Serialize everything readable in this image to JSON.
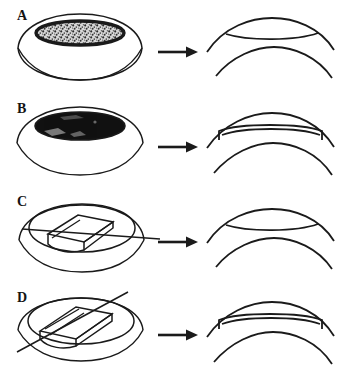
{
  "figure": {
    "background_color": "#ffffff",
    "ink_color": "#1a1a1a",
    "width": 346,
    "height": 372,
    "panel_count": 4
  },
  "panels": [
    {
      "label": "A",
      "left_view": {
        "name": "cornea-dome-surface-ablation-shallow",
        "dome_type": "flattened-dome",
        "treatment_zone": "stippled-ellipse",
        "treatment_fill": "stipple-light",
        "depth": "shallow"
      },
      "arrow": {
        "name": "transform-arrow",
        "direction": "right",
        "glyph": "solid-arrow"
      },
      "right_view": {
        "name": "cornea-cross-section-thin-lenticule",
        "profile": "thin-lenticule",
        "has_end_walls": false,
        "layers": 2
      }
    },
    {
      "label": "B",
      "left_view": {
        "name": "cornea-dome-surface-ablation-deep",
        "dome_type": "flattened-dome",
        "treatment_zone": "solid-ellipse",
        "treatment_fill": "solid-black",
        "depth": "deep"
      },
      "arrow": {
        "name": "transform-arrow",
        "direction": "right",
        "glyph": "solid-arrow"
      },
      "right_view": {
        "name": "cornea-cross-section-thick-flap",
        "profile": "thick-flap-with-step-edges",
        "has_end_walls": true,
        "layers": 2
      }
    },
    {
      "label": "C",
      "left_view": {
        "name": "cornea-dome-lamellar-keratectomy-shallow",
        "dome_type": "flattened-dome",
        "treatment_zone": "rectangular-lamellar-slab",
        "blade_path": "shallow-horizontal",
        "depth": "shallow"
      },
      "arrow": {
        "name": "transform-arrow",
        "direction": "right",
        "glyph": "solid-arrow"
      },
      "right_view": {
        "name": "cornea-cross-section-thin-lenticule",
        "profile": "thin-lenticule",
        "has_end_walls": false,
        "layers": 2
      }
    },
    {
      "label": "D",
      "left_view": {
        "name": "cornea-dome-lamellar-keratectomy-deep",
        "dome_type": "flattened-dome",
        "treatment_zone": "rectangular-lamellar-slab-deep",
        "blade_path": "steep-oblique",
        "depth": "deep"
      },
      "arrow": {
        "name": "transform-arrow",
        "direction": "right",
        "glyph": "solid-arrow"
      },
      "right_view": {
        "name": "cornea-cross-section-thick-flap",
        "profile": "thick-flap-with-step-edges",
        "has_end_walls": true,
        "layers": 2
      }
    }
  ]
}
